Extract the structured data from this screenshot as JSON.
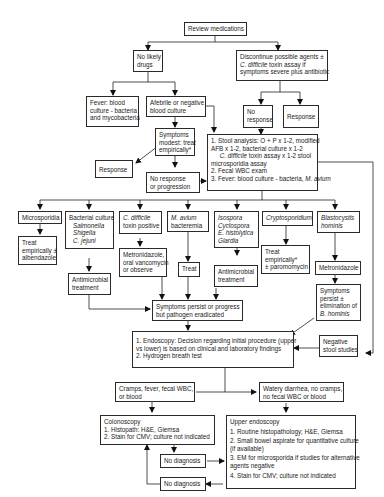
{
  "nodes": {
    "review": {
      "lines": [
        "Review medications"
      ]
    },
    "no_likely": {
      "lines": [
        "No likely",
        "drugs"
      ]
    },
    "discontinue": {
      "lines": [
        "Discontinue possible agents ±",
        "C. difficile",
        " toxin assay if",
        "symptoms severe plus antibiotic"
      ]
    },
    "fever": {
      "lines": [
        "Fever:  blood",
        "culture - bacteria",
        "and mycobacteria"
      ]
    },
    "afebrile": {
      "lines": [
        "Afebrile or negative",
        "blood culture"
      ]
    },
    "no_response_top": {
      "lines": [
        "No",
        "response"
      ]
    },
    "response_top": {
      "lines": [
        "Response"
      ]
    },
    "symptoms_modest": {
      "lines": [
        "Symptoms",
        "modest:  treat",
        "empirically*"
      ]
    },
    "response_left": {
      "lines": [
        "Response"
      ]
    },
    "no_resp_prog": {
      "lines": [
        "No response",
        "or progression"
      ]
    },
    "stool": {
      "items": [
        "1.  Stool analysis:  O + P x 1-2, modified",
        "     AFB x 1-2, bacterial culture x 1-2",
        "C. difficile",
        " toxin assay x 1-2 stool",
        "     microsporidia assay",
        "2.  Fecal WBC exam",
        "3.  Fever:  blood culture - bacteria, ",
        "M. avium"
      ]
    },
    "microsporidia": {
      "lines": [
        "Microsporidia"
      ]
    },
    "bacterial": {
      "lines": [
        "Bacterial culture",
        "Salmonella",
        "Shigella",
        "C. jejuni"
      ]
    },
    "cdiff_pos": {
      "lines": [
        "C. difficile",
        "toxin positive"
      ]
    },
    "mavium": {
      "lines": [
        "M. avium",
        "bacteremia"
      ]
    },
    "isospora": {
      "lines": [
        "Isospora",
        "Cyclospora",
        "E. histolytica",
        "Giardia"
      ]
    },
    "crypto": {
      "lines": [
        "Cryptosporidium"
      ]
    },
    "blasto": {
      "lines": [
        "Blastocystis",
        "hominis"
      ]
    },
    "treat_albend": {
      "lines": [
        "Treat",
        "empirically ±",
        "albendazole"
      ]
    },
    "antimicrobial_1": {
      "lines": [
        "Antimicrobial",
        "treatment"
      ]
    },
    "metronid_vanc": {
      "lines": [
        "Metronidazole,",
        "oral vancomycin",
        "or observe"
      ]
    },
    "treat": {
      "lines": [
        "Treat"
      ]
    },
    "antimicrobial_2": {
      "lines": [
        "Antimicrobial",
        "treatment"
      ]
    },
    "treat_paro": {
      "lines": [
        "Treat",
        "empirically*",
        "± paromomycin"
      ]
    },
    "metronid": {
      "lines": [
        "Metronidazole"
      ]
    },
    "symptoms_persist_b": {
      "lines": [
        "Symptoms",
        "persist ±",
        "elimination of",
        "B. hominis"
      ]
    },
    "symptoms_persist": {
      "lines": [
        "Symptoms persist or progress",
        "but pathogen eradicated"
      ]
    },
    "negative_stool": {
      "lines": [
        "Negative",
        "stool studies"
      ]
    },
    "endoscopy": {
      "lines": [
        "1.  Endoscopy:  Decision regarding initial procedure (upper",
        "     vs lower) is based on clinical and laboratory findings",
        "2.  Hydrogen breath test"
      ]
    },
    "cramps": {
      "lines": [
        "Cramps, fever, fecal WBC,",
        "or blood"
      ]
    },
    "watery": {
      "lines": [
        "Watery diarrhea, no cramps,",
        "no fecal WBC or blood"
      ]
    },
    "colonoscopy": {
      "lines": [
        "Colonoscopy",
        "1.  Histopath:  H&E, Giemsa",
        "2.  Stain for CMV; culture not indicated"
      ]
    },
    "no_dx_1": {
      "lines": [
        "No diagnosis"
      ]
    },
    "no_dx_2": {
      "lines": [
        "No diagnosis"
      ]
    },
    "upper_endo": {
      "lines": [
        "Upper endoscopy",
        "1.  Routine histopathology; H&E, Giemsa",
        "2.  Small bowel aspirate for quantitative culture",
        "     (if available)",
        "3.  EM for microsporida if studies for alternative",
        "     agents negative",
        "4.  Stain for CMV; culture not indicated"
      ]
    }
  }
}
